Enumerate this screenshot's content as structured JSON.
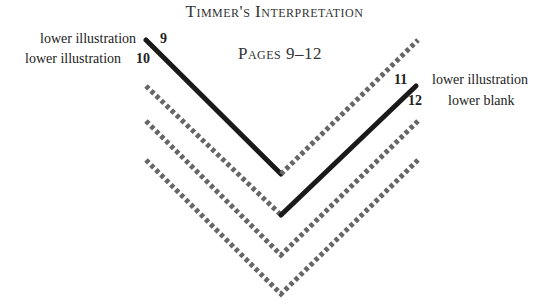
{
  "title": "Timmer's Interpretation",
  "subtitle": "Pages 9–12",
  "left_labels": [
    {
      "text": "lower illustration",
      "page": "9"
    },
    {
      "text": "lower illustration",
      "page": "10"
    }
  ],
  "right_labels": [
    {
      "text": "lower illustration",
      "page": "11"
    },
    {
      "text": "lower blank",
      "page": "12"
    }
  ],
  "colors": {
    "solid_line": "#1a1a1a",
    "dashed_line": "#666666",
    "text": "#222222"
  },
  "diagram": {
    "shapes": [
      {
        "name": "v1",
        "left_arm": "solid",
        "right_arm": "dashed"
      },
      {
        "name": "v2",
        "left_arm": "dashed",
        "right_arm": "solid"
      },
      {
        "name": "v3",
        "left_arm": "dashed",
        "right_arm": "dashed"
      },
      {
        "name": "v4",
        "left_arm": "dashed",
        "right_arm": "dashed"
      }
    ]
  }
}
